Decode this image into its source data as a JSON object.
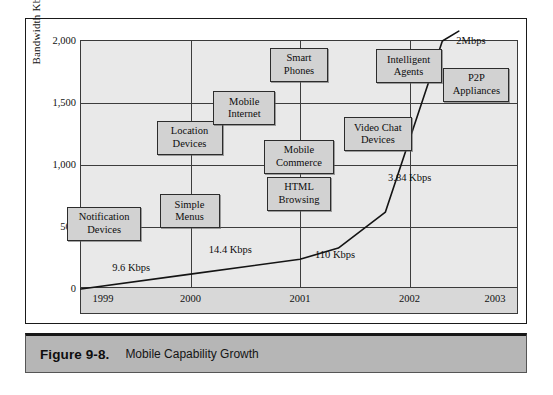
{
  "figure": {
    "label": "Figure 9-8.",
    "title": "Mobile Capability Growth"
  },
  "chart_data": {
    "type": "line",
    "title": "Mobile Capability Growth",
    "xlabel": "",
    "ylabel": "Bandwidth Kbps",
    "xlim": [
      1999,
      2003
    ],
    "ylim": [
      0,
      2000
    ],
    "grid": true,
    "legend": "none",
    "x_ticks": [
      "1999",
      "2000",
      "2001",
      "2002",
      "2003"
    ],
    "y_ticks": [
      "0",
      "500",
      "1,000",
      "1,500",
      "2,000"
    ],
    "series": [
      {
        "name": "Bandwidth growth curve",
        "points": [
          {
            "x": 1999.0,
            "y": 0
          },
          {
            "x": 2000.0,
            "y": 120
          },
          {
            "x": 2001.0,
            "y": 240
          },
          {
            "x": 2001.35,
            "y": 330
          },
          {
            "x": 2001.78,
            "y": 620
          },
          {
            "x": 2002.3,
            "y": 2000
          },
          {
            "x": 2002.45,
            "y": 2080
          }
        ]
      }
    ],
    "annotations": [
      {
        "text": "9.6 Kbps",
        "x": 1999.55,
        "y": 150
      },
      {
        "text": "14.4 Kbps",
        "x": 2000.45,
        "y": 300
      },
      {
        "text": "110 Kbps",
        "x": 2001.2,
        "y": 260
      },
      {
        "text": "3.84 Kbps",
        "x": 2001.85,
        "y": 880
      },
      {
        "text": "2Mbps",
        "x": 2002.4,
        "y": 1980
      }
    ],
    "nodes": [
      {
        "id": "notification-devices",
        "lines": [
          "Notification",
          "Devices"
        ],
        "x": 1999.22,
        "y": 520
      },
      {
        "id": "simple-menus",
        "lines": [
          "Simple",
          "Menus"
        ],
        "x": 2000.0,
        "y": 620
      },
      {
        "id": "location-devices",
        "lines": [
          "Location",
          "Devices"
        ],
        "x": 2000.0,
        "y": 1210
      },
      {
        "id": "mobile-internet",
        "lines": [
          "Mobile",
          "Internet"
        ],
        "x": 2000.5,
        "y": 1450
      },
      {
        "id": "html-browsing",
        "lines": [
          "HTML",
          "Browsing"
        ],
        "x": 2001.0,
        "y": 760
      },
      {
        "id": "mobile-commerce",
        "lines": [
          "Mobile",
          "Commerce"
        ],
        "x": 2001.0,
        "y": 1060
      },
      {
        "id": "smart-phones",
        "lines": [
          "Smart",
          "Phones"
        ],
        "x": 2001.0,
        "y": 1800
      },
      {
        "id": "video-chat-devices",
        "lines": [
          "Video Chat",
          "Devices"
        ],
        "x": 2001.72,
        "y": 1240
      },
      {
        "id": "intelligent-agents",
        "lines": [
          "Intelligent",
          "Agents"
        ],
        "x": 2002.0,
        "y": 1790
      },
      {
        "id": "p2p-appliances",
        "lines": [
          "P2P",
          "Appliances"
        ],
        "x": 2002.62,
        "y": 1640
      }
    ]
  },
  "axis": {
    "y_title": "Bandwidth Kbps"
  },
  "colors": {
    "plot_background": "#e9e9e9",
    "axis_strip": "#d8d8d8",
    "node_fill": "#d2d2d2",
    "node_border": "#2c2c2c",
    "caption_bar": "#b6b6b6",
    "line": "#141414"
  }
}
